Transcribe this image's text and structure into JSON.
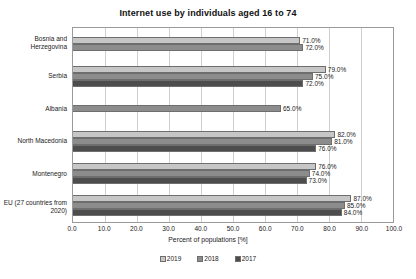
{
  "chart_data": {
    "type": "bar",
    "orientation": "horizontal",
    "title": "Internet use by individuals aged 16 to 74",
    "xlabel": "Percent of populations [%]",
    "ylabel": "",
    "xlim": [
      0,
      100
    ],
    "xticks": [
      "0.0",
      "10.0",
      "20.0",
      "30.0",
      "40.0",
      "50.0",
      "60.0",
      "70.0",
      "80.0",
      "90.0",
      "100.0"
    ],
    "grid": true,
    "legend_position": "bottom",
    "categories": [
      "Bosnia and Herzegovina",
      "Serbia",
      "Albania",
      "North Macedonia",
      "Montenegro",
      "EU (27 countries from 2020)"
    ],
    "series": [
      {
        "name": "2019",
        "color": "#c6c6c6",
        "values": [
          71.0,
          79.0,
          null,
          82.0,
          76.0,
          87.0
        ],
        "labels": [
          "71.0%",
          "79.0%",
          null,
          "82.0%",
          "76.0%",
          "87.0%"
        ]
      },
      {
        "name": "2018",
        "color": "#8c8c8c",
        "values": [
          72.0,
          75.0,
          65.0,
          81.0,
          74.0,
          85.0
        ],
        "labels": [
          "72.0%",
          "75.0%",
          "65.0%",
          "81.0%",
          "74.0%",
          "85.0%"
        ]
      },
      {
        "name": "2017",
        "color": "#4d4d4d",
        "values": [
          null,
          72.0,
          null,
          76.0,
          73.0,
          84.0
        ],
        "labels": [
          null,
          "72.0%",
          null,
          "76.0%",
          "73.0%",
          "84.0%"
        ]
      }
    ]
  },
  "legend": {
    "items": [
      {
        "label": "2019",
        "series_class": "s2019"
      },
      {
        "label": "2018",
        "series_class": "s2018"
      },
      {
        "label": "2017",
        "series_class": "s2017"
      }
    ]
  }
}
